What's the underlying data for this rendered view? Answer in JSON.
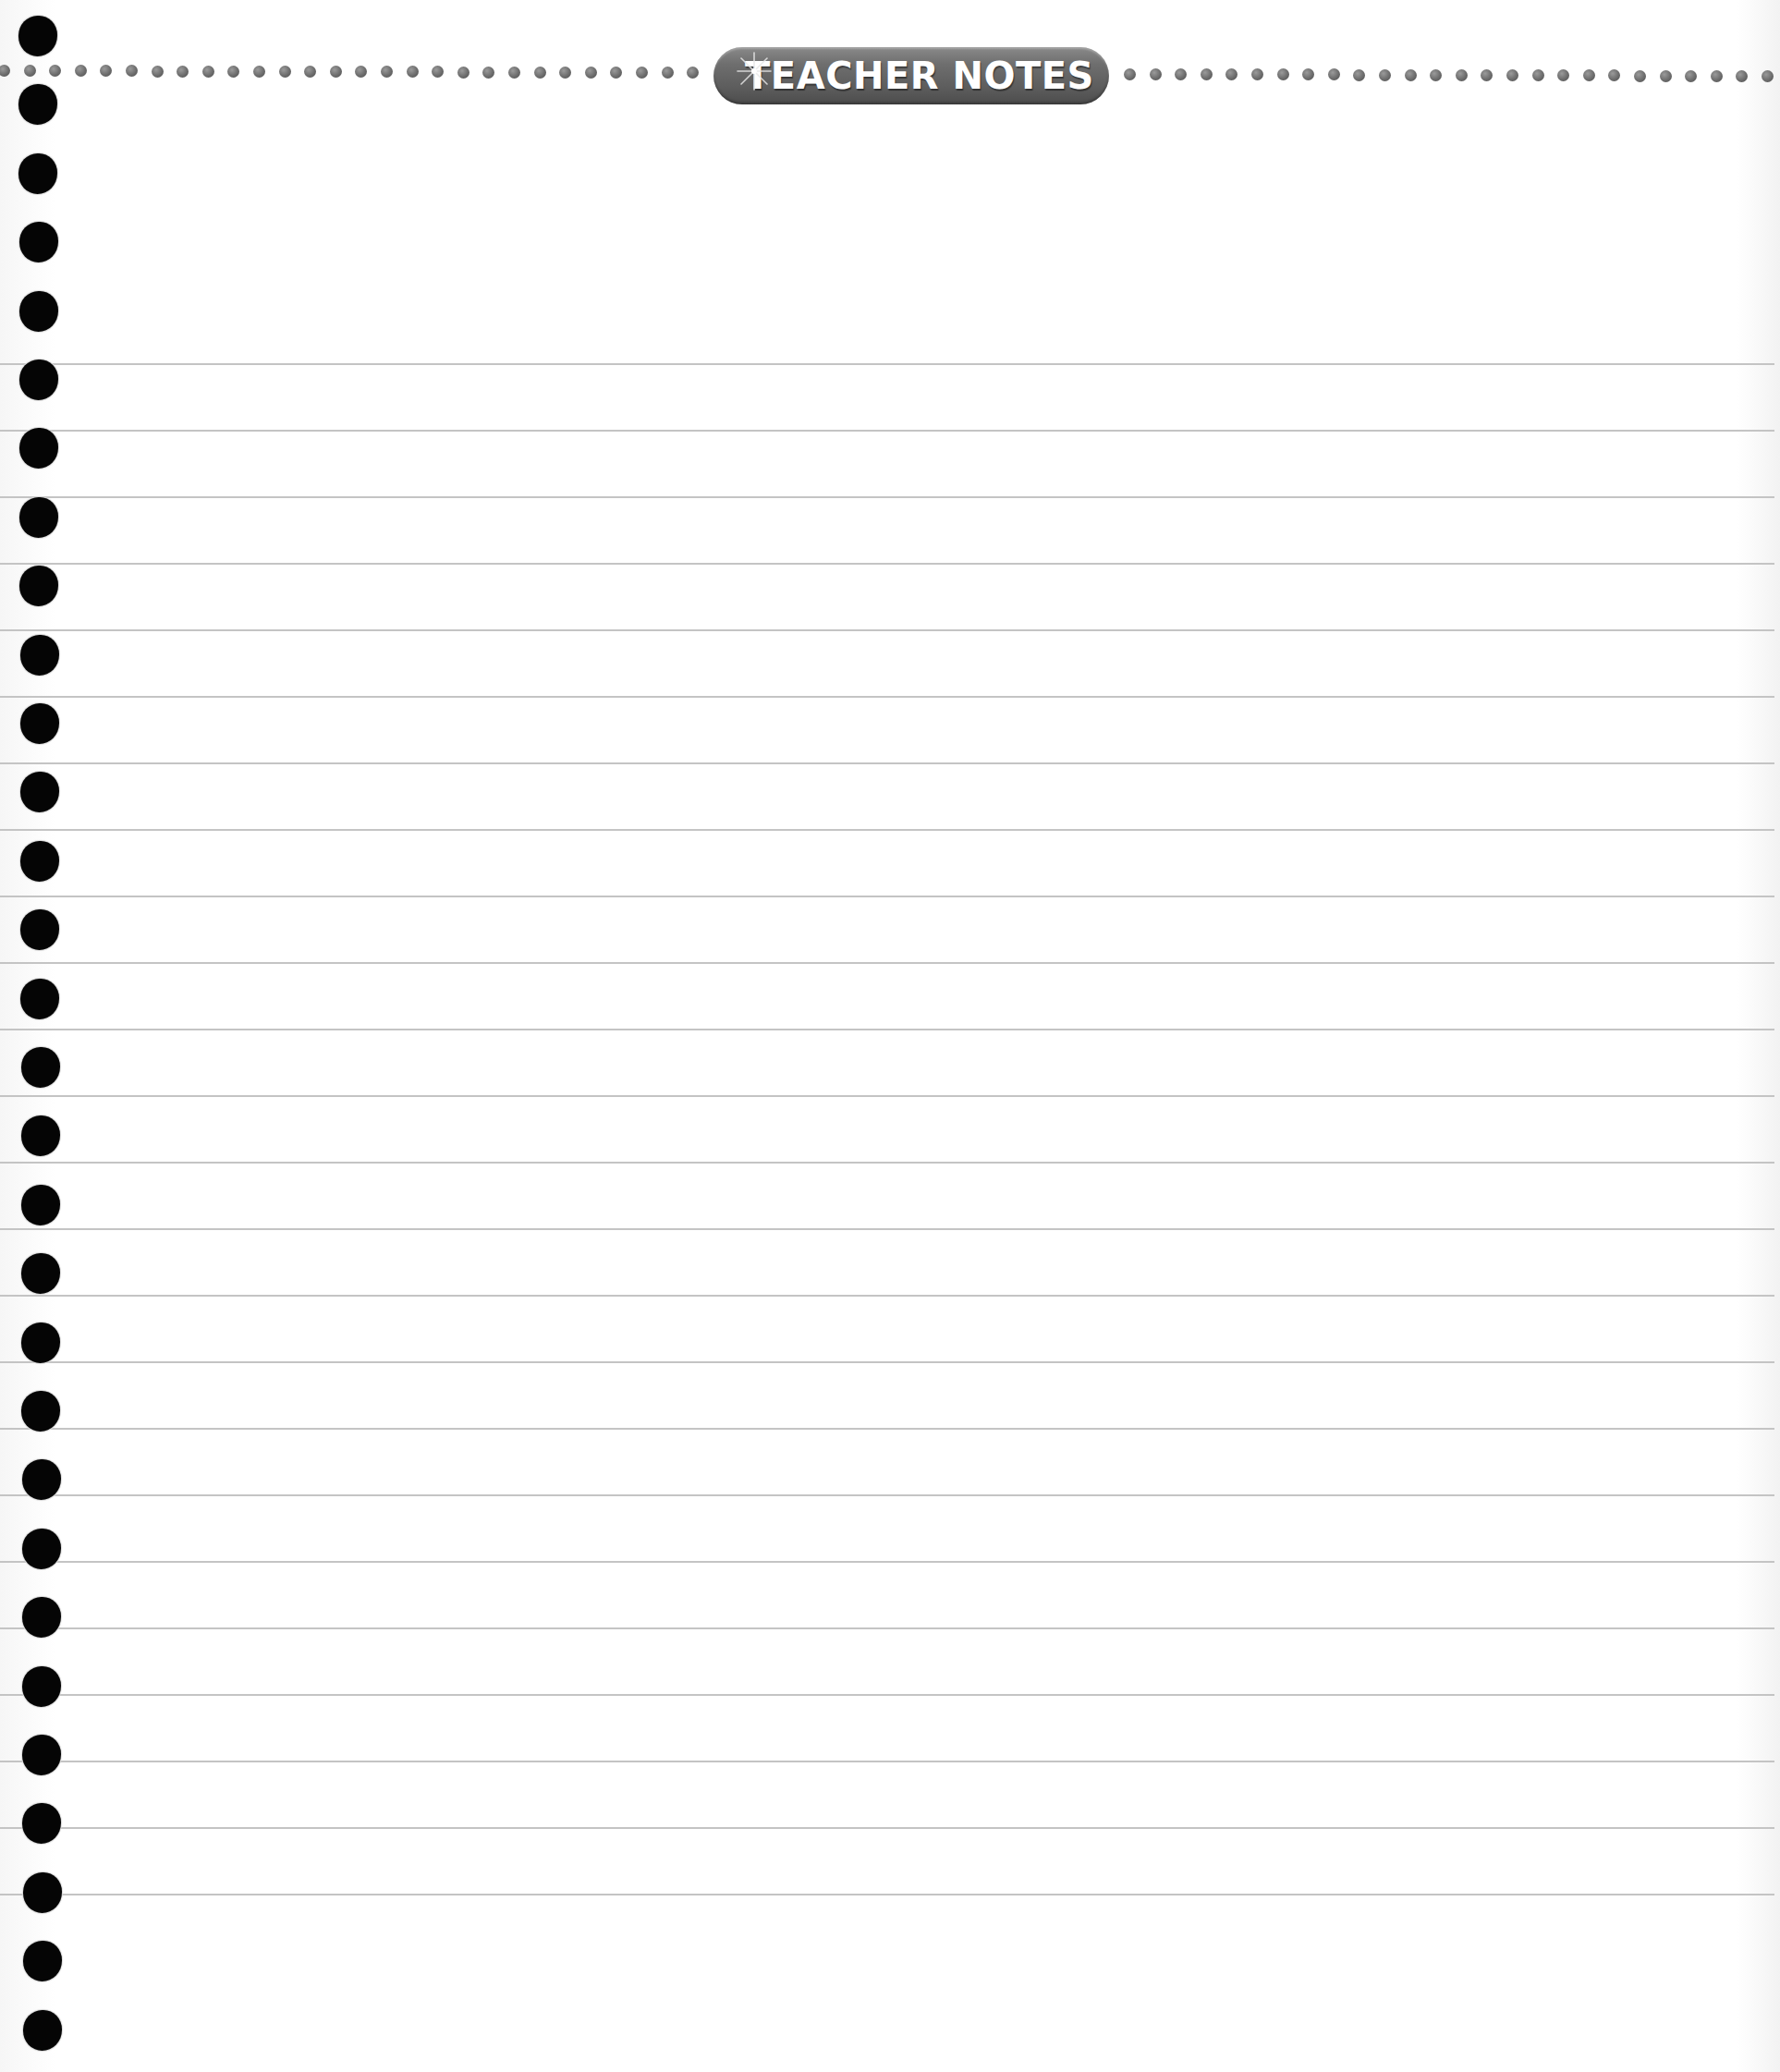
{
  "page": {
    "header": {
      "title": "TEACHER NOTES",
      "icon": "sparkle-icon"
    },
    "colors": {
      "pill_gray": "#5d5d5d",
      "dot_gray": "#6c6c6c",
      "rule_gray": "#c4c4c4",
      "hole_black": "#050505",
      "paper": "#ffffff"
    },
    "ruled_lines": {
      "count": 24,
      "first_y": 393,
      "spacing": 72
    },
    "binder_holes": {
      "count": 30,
      "first_y": 39,
      "spacing": 74.4
    },
    "dot_leader": {
      "left_count": 19,
      "right_count": 18,
      "spacing": 27.6
    }
  }
}
